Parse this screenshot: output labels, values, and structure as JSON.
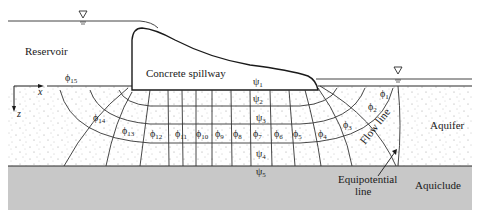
{
  "figure": {
    "labels": {
      "reservoir": "Reservoir",
      "spillway": "Concrete spillway",
      "aquifer": "Aquifer",
      "aquiclude": "Aquiclude",
      "flow_line": "Flow line",
      "equipotential_1": "Equipotential",
      "equipotential_2": "line",
      "axis_x": "x",
      "axis_z": "z"
    },
    "psi_labels": [
      {
        "sym": "ψ",
        "sub": "1"
      },
      {
        "sym": "ψ",
        "sub": "2"
      },
      {
        "sym": "ψ",
        "sub": "3"
      },
      {
        "sym": "ψ",
        "sub": "4"
      },
      {
        "sym": "ψ",
        "sub": "5"
      }
    ],
    "phi_labels": [
      {
        "sym": "ϕ",
        "sub": "1"
      },
      {
        "sym": "ϕ",
        "sub": "2"
      },
      {
        "sym": "ϕ",
        "sub": "3"
      },
      {
        "sym": "ϕ",
        "sub": "4"
      },
      {
        "sym": "ϕ",
        "sub": "5"
      },
      {
        "sym": "ϕ",
        "sub": "6"
      },
      {
        "sym": "ϕ",
        "sub": "7"
      },
      {
        "sym": "ϕ",
        "sub": "8"
      },
      {
        "sym": "ϕ",
        "sub": "9"
      },
      {
        "sym": "ϕ",
        "sub": "10"
      },
      {
        "sym": "ϕ",
        "sub": "11"
      },
      {
        "sym": "ϕ",
        "sub": "12"
      },
      {
        "sym": "ϕ",
        "sub": "13"
      },
      {
        "sym": "ϕ",
        "sub": "14"
      },
      {
        "sym": "ϕ",
        "sub": "15"
      }
    ],
    "water_table_symbol": "▽",
    "colors": {
      "aquiclude": "#c8c8c8",
      "line": "#2a2a2a",
      "dots": "#8a8a8a"
    }
  }
}
